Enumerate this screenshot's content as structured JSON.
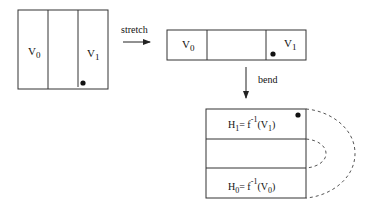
{
  "diagram": {
    "initial_box": {
      "cells": 3,
      "labels": {
        "left": "V",
        "left_sub": "0",
        "right": "V",
        "right_sub": "1"
      },
      "has_dot": true
    },
    "arrow_stretch": {
      "label": "stretch"
    },
    "stretched_box": {
      "cells": 3,
      "labels": {
        "left": "V",
        "left_sub": "0",
        "right": "V",
        "right_sub": "1"
      },
      "has_dot": true
    },
    "arrow_bend": {
      "label": "bend"
    },
    "bent_box": {
      "rows": 3,
      "top_label": {
        "H": "H",
        "H_sub": "1",
        "eq": "= f",
        "sup": "-1",
        "arg_open": "(V",
        "arg_sub": "1",
        "arg_close": ")"
      },
      "bottom_label": {
        "H": "H",
        "H_sub": "0",
        "eq": "= f",
        "sup": "-1",
        "arg_open": "(V",
        "arg_sub": "0",
        "arg_close": ")"
      },
      "has_dot": true,
      "dashed_arcs": 2
    },
    "colors": {
      "stroke": "#333333",
      "dash": "#555555",
      "dot": "#111111"
    }
  }
}
